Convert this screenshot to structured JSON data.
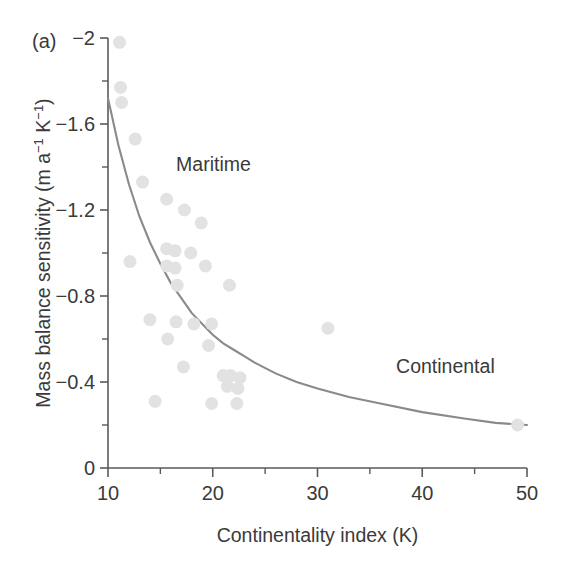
{
  "panel": {
    "label": "(a)"
  },
  "chart_data": {
    "type": "scatter",
    "title": "",
    "panel_label": "(a)",
    "xlabel": "Continentality index (K)",
    "ylabel": "Mass balance sensitivity (m a⁻¹ K⁻¹)",
    "ylabel_parts": {
      "lead": "Mass balance sensitivity (m a",
      "sup1": "−1",
      "mid": " K",
      "sup2": "−1",
      "tail": ")"
    },
    "xlim": [
      10,
      50
    ],
    "ylim": [
      -2,
      0
    ],
    "y_inverted": true,
    "grid": false,
    "legend": "none",
    "x_ticks": [
      10,
      20,
      30,
      40,
      50
    ],
    "x_tick_labels": [
      "10",
      "20",
      "30",
      "40",
      "50"
    ],
    "x_minor_ticks": [
      15,
      25,
      35,
      45
    ],
    "y_ticks": [
      -2,
      -1.6,
      -1.2,
      -0.8,
      -0.4,
      0
    ],
    "y_tick_labels": [
      "−2",
      "−1.6",
      "−1.2",
      "−0.8",
      "−0.4",
      "0"
    ],
    "y_minor_ticks": [
      -1.8,
      -1.4,
      -1.0,
      -0.6,
      -0.2
    ],
    "marker": {
      "shape": "circle",
      "color": "#e2e2e2",
      "size_px": 13
    },
    "curve": {
      "label": "fitted trend",
      "color": "#8a8a8a",
      "type": "exponential-decay"
    },
    "annotations": [
      {
        "text": "Maritime",
        "x": 16.5,
        "y": -1.38
      },
      {
        "text": "Continental",
        "x": 37.5,
        "y": -0.44
      }
    ],
    "points": [
      {
        "x": 11.1,
        "y": -1.98
      },
      {
        "x": 11.2,
        "y": -1.77
      },
      {
        "x": 11.3,
        "y": -1.7
      },
      {
        "x": 12.6,
        "y": -1.53
      },
      {
        "x": 13.3,
        "y": -1.33
      },
      {
        "x": 15.6,
        "y": -1.25
      },
      {
        "x": 17.3,
        "y": -1.2
      },
      {
        "x": 18.9,
        "y": -1.14
      },
      {
        "x": 15.6,
        "y": -1.02
      },
      {
        "x": 16.4,
        "y": -1.01
      },
      {
        "x": 17.9,
        "y": -1.0
      },
      {
        "x": 12.1,
        "y": -0.96
      },
      {
        "x": 15.6,
        "y": -0.94
      },
      {
        "x": 16.4,
        "y": -0.93
      },
      {
        "x": 19.3,
        "y": -0.94
      },
      {
        "x": 16.6,
        "y": -0.85
      },
      {
        "x": 21.6,
        "y": -0.85
      },
      {
        "x": 14.0,
        "y": -0.69
      },
      {
        "x": 16.5,
        "y": -0.68
      },
      {
        "x": 18.2,
        "y": -0.67
      },
      {
        "x": 19.9,
        "y": -0.67
      },
      {
        "x": 31.0,
        "y": -0.65
      },
      {
        "x": 15.7,
        "y": -0.6
      },
      {
        "x": 19.6,
        "y": -0.57
      },
      {
        "x": 17.2,
        "y": -0.47
      },
      {
        "x": 21.0,
        "y": -0.43
      },
      {
        "x": 21.7,
        "y": -0.43
      },
      {
        "x": 22.6,
        "y": -0.42
      },
      {
        "x": 21.4,
        "y": -0.38
      },
      {
        "x": 22.4,
        "y": -0.37
      },
      {
        "x": 14.5,
        "y": -0.31
      },
      {
        "x": 19.9,
        "y": -0.3
      },
      {
        "x": 22.3,
        "y": -0.3
      },
      {
        "x": 49.1,
        "y": -0.2
      }
    ],
    "curve_points": [
      {
        "x": 10.0,
        "y": -1.72
      },
      {
        "x": 11.0,
        "y": -1.5
      },
      {
        "x": 12.0,
        "y": -1.32
      },
      {
        "x": 13.0,
        "y": -1.17
      },
      {
        "x": 14.0,
        "y": -1.05
      },
      {
        "x": 15.0,
        "y": -0.95
      },
      {
        "x": 16.0,
        "y": -0.86
      },
      {
        "x": 17.0,
        "y": -0.79
      },
      {
        "x": 18.0,
        "y": -0.72
      },
      {
        "x": 19.0,
        "y": -0.67
      },
      {
        "x": 20.0,
        "y": -0.62
      },
      {
        "x": 21.0,
        "y": -0.58
      },
      {
        "x": 22.0,
        "y": -0.55
      },
      {
        "x": 23.0,
        "y": -0.52
      },
      {
        "x": 24.0,
        "y": -0.49
      },
      {
        "x": 26.0,
        "y": -0.44
      },
      {
        "x": 28.0,
        "y": -0.4
      },
      {
        "x": 30.0,
        "y": -0.37
      },
      {
        "x": 33.0,
        "y": -0.33
      },
      {
        "x": 36.0,
        "y": -0.3
      },
      {
        "x": 40.0,
        "y": -0.26
      },
      {
        "x": 44.0,
        "y": -0.23
      },
      {
        "x": 47.0,
        "y": -0.21
      },
      {
        "x": 50.0,
        "y": -0.2
      }
    ]
  }
}
